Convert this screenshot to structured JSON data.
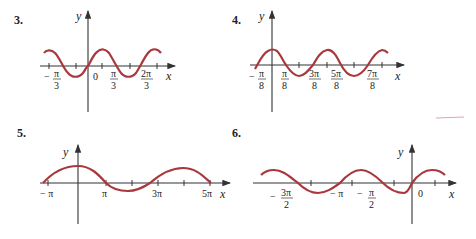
{
  "problems": [
    {
      "number": "3.",
      "x_label": "x",
      "y_label": "y",
      "tick_labels": [
        {
          "num": "− π",
          "den": "3",
          "sign": "",
          "pos": "-π/3"
        },
        {
          "text": "0"
        },
        {
          "num": "π",
          "den": "3"
        },
        {
          "num": "2π",
          "den": "3"
        }
      ]
    },
    {
      "number": "4.",
      "x_label": "x",
      "y_label": "y",
      "tick_labels": [
        {
          "num": "− π",
          "den": "8"
        },
        {
          "num": "π",
          "den": "8"
        },
        {
          "num": "3π",
          "den": "8"
        },
        {
          "num": "5π",
          "den": "8"
        },
        {
          "num": "7π",
          "den": "8"
        }
      ]
    },
    {
      "number": "5.",
      "x_label": "x",
      "y_label": "y",
      "tick_labels": [
        {
          "text": "− π"
        },
        {
          "text": "π"
        },
        {
          "text": "3π"
        },
        {
          "text": "5π"
        }
      ]
    },
    {
      "number": "6.",
      "x_label": "x",
      "y_label": "y",
      "tick_labels": [
        {
          "num": "3π",
          "den": "2",
          "prefix": "−"
        },
        {
          "text": "− π"
        },
        {
          "num": "π",
          "den": "2",
          "prefix": "−"
        },
        {
          "text": "0"
        }
      ]
    }
  ],
  "colors": {
    "curve": "#a8383d",
    "axis": "#333333"
  }
}
